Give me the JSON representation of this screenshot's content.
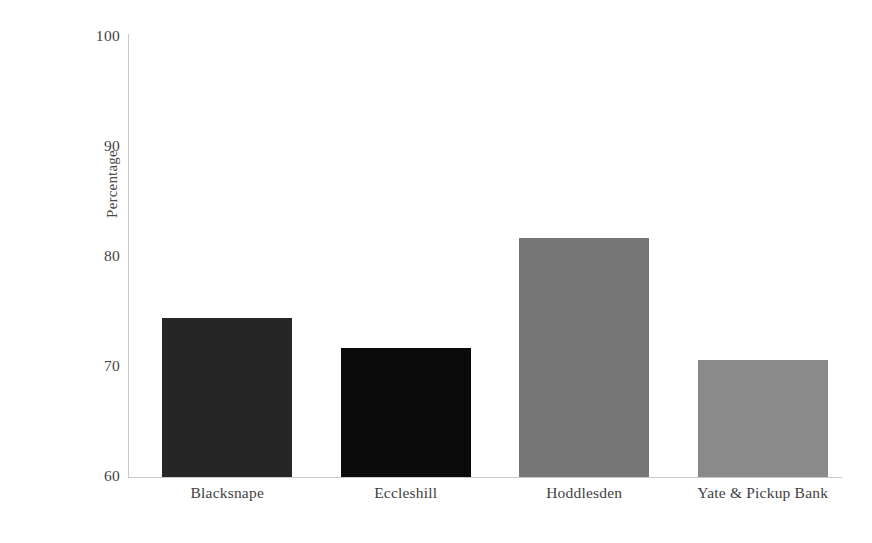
{
  "chart_data": {
    "type": "bar",
    "title": "",
    "subtitle": "",
    "xlabel": "",
    "ylabel": "Percentage",
    "categories": [
      "Blacksnape",
      "Eccleshill",
      "Hoddlesden",
      "Yate & Pickup Bank"
    ],
    "values": [
      74.5,
      71.7,
      81.7,
      70.6
    ],
    "ylim": [
      60,
      100
    ],
    "yticks": [
      "100",
      "90",
      "80",
      "70",
      "60"
    ],
    "ytick_values": [
      100,
      90,
      80,
      70,
      60
    ],
    "grid": false,
    "legend": "none",
    "bar_colors": [
      "#262626",
      "#0b0b0b",
      "#767676",
      "#8a8a8a"
    ],
    "axis_color": "#c9c9c9",
    "background": "#ffffff"
  },
  "axes": {
    "y_title": "Percentage"
  }
}
